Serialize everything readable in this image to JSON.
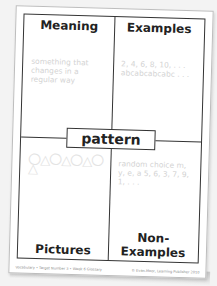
{
  "card": {
    "center_word": "pattern",
    "quadrants": {
      "meaning": {
        "title": "Meaning",
        "text": "something that changes in a regular way"
      },
      "examples": {
        "title": "Examples",
        "text": "2, 4, 6, 8, 10, . . . abcabcabcabc . . ."
      },
      "pictures": {
        "title": "Pictures",
        "text": "〇△〇△〇△〇△"
      },
      "non_examples": {
        "title": "Non-Examples",
        "text": "random choice m, y, e, a  5, 6, 3, 7, 9, 1, . . ."
      }
    },
    "footer_left": "Vocabulary • Target Number 3 • Week 6 Glossary",
    "footer_right": "© Evan-Moor, Learning Publisher 2010"
  }
}
